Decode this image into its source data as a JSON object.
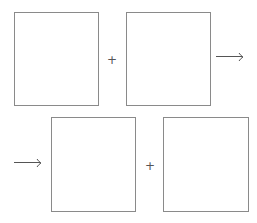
{
  "diagram": {
    "rows": [
      {
        "boxes": [
          {
            "id": "box-1",
            "label": ""
          },
          {
            "id": "box-2",
            "label": ""
          }
        ],
        "operator": "+",
        "arrow": "→"
      },
      {
        "arrow": "→",
        "boxes": [
          {
            "id": "box-3",
            "label": ""
          },
          {
            "id": "box-4",
            "label": ""
          }
        ],
        "operator": "+"
      }
    ],
    "colors": {
      "border": "#8a8a8a",
      "symbol": "#555555",
      "background": "#ffffff"
    }
  }
}
